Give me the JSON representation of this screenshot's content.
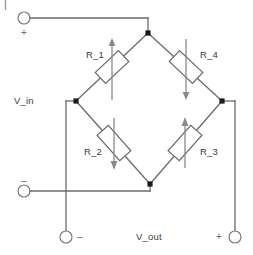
{
  "figure": {
    "type": "circuit-schematic",
    "name": "Wheatstone bridge",
    "width": 253,
    "height": 255,
    "background_color": "#ffffff",
    "wire_color": "#6b6b6b",
    "node_color": "#1a1a1a",
    "arrow_color": "#8a8a8a",
    "text_color": "#3b3b3b"
  },
  "labels": {
    "r1": "R_1",
    "r2": "R_2",
    "r3": "R_3",
    "r4": "R_4",
    "v_in": "V_in",
    "v_out": "V_out",
    "v_in_plus": "+",
    "v_in_minus": "–",
    "v_out_minus": "–",
    "v_out_plus": "+"
  },
  "components": [
    {
      "id": "R_1",
      "label": "R_1",
      "kind": "variable-resistor",
      "arrow_direction": "up",
      "bridge_arm": "top-left"
    },
    {
      "id": "R_4",
      "label": "R_4",
      "kind": "variable-resistor",
      "arrow_direction": "down",
      "bridge_arm": "top-right"
    },
    {
      "id": "R_2",
      "label": "R_2",
      "kind": "variable-resistor",
      "arrow_direction": "down",
      "bridge_arm": "bottom-left"
    },
    {
      "id": "R_3",
      "label": "R_3",
      "kind": "variable-resistor",
      "arrow_direction": "up",
      "bridge_arm": "bottom-right"
    }
  ],
  "terminals": [
    {
      "id": "v_in_plus",
      "sign": "+",
      "port": "V_in",
      "polarity": "positive",
      "position": "top-left"
    },
    {
      "id": "v_in_minus",
      "sign": "–",
      "port": "V_in",
      "polarity": "negative",
      "position": "left-lower"
    },
    {
      "id": "v_out_minus",
      "sign": "–",
      "port": "V_out",
      "polarity": "negative",
      "position": "bottom-left"
    },
    {
      "id": "v_out_plus",
      "sign": "+",
      "port": "V_out",
      "polarity": "positive",
      "position": "bottom-right"
    }
  ],
  "nodes": [
    {
      "id": "top",
      "x": 148,
      "y": 33
    },
    {
      "id": "left",
      "x": 76,
      "y": 101
    },
    {
      "id": "right",
      "x": 222,
      "y": 101
    },
    {
      "id": "bottom",
      "x": 150,
      "y": 184
    }
  ]
}
